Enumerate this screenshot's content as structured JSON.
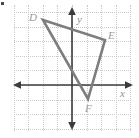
{
  "figure": {
    "width": 139,
    "height": 138,
    "background": "#ffffff",
    "corner_mark": "corner-mark"
  },
  "axes": {
    "x_label": "x",
    "y_label": "y",
    "axis_color": "#3b3b3b",
    "grid_color": "#c9c9c9",
    "grid_spacing_px": 14.6,
    "origin_px": {
      "x": 72,
      "y": 85
    },
    "x_range": [
      -5,
      4
    ],
    "y_range": [
      -3,
      5
    ],
    "grid": "on",
    "x_tick_labels": [],
    "y_tick_labels": []
  },
  "chart_data": {
    "type": "scatter",
    "title": "",
    "xlabel": "x",
    "ylabel": "y",
    "xlim": [
      -5,
      4
    ],
    "ylim": [
      -3,
      5
    ],
    "grid": "on",
    "legend": "none",
    "shape": "triangle",
    "shape_color": "#7d7d7d",
    "vertices": [
      {
        "label": "D",
        "x": -2,
        "y": 4.5,
        "px": 43,
        "py": 20,
        "label_px": 29,
        "label_py": 12
      },
      {
        "label": "E",
        "x": 2.3,
        "y": 3.1,
        "px": 105,
        "py": 40,
        "label_px": 108,
        "label_py": 30
      },
      {
        "label": "F",
        "x": 1.1,
        "y": -1,
        "px": 88,
        "py": 99,
        "label_px": 85,
        "label_py": 103
      }
    ],
    "edges": [
      [
        "D",
        "E"
      ],
      [
        "E",
        "F"
      ],
      [
        "F",
        "D"
      ]
    ]
  }
}
